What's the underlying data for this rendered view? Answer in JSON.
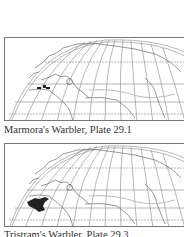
{
  "figures": [
    {
      "caption": "Marmora's Warbler, Plate 29.1",
      "range_region": "western-mediterranean-islands",
      "range_color": "#222222"
    },
    {
      "caption": "Tristram's Warbler, Plate 29.3",
      "range_region": "northwest-africa",
      "range_color": "#222222"
    }
  ]
}
